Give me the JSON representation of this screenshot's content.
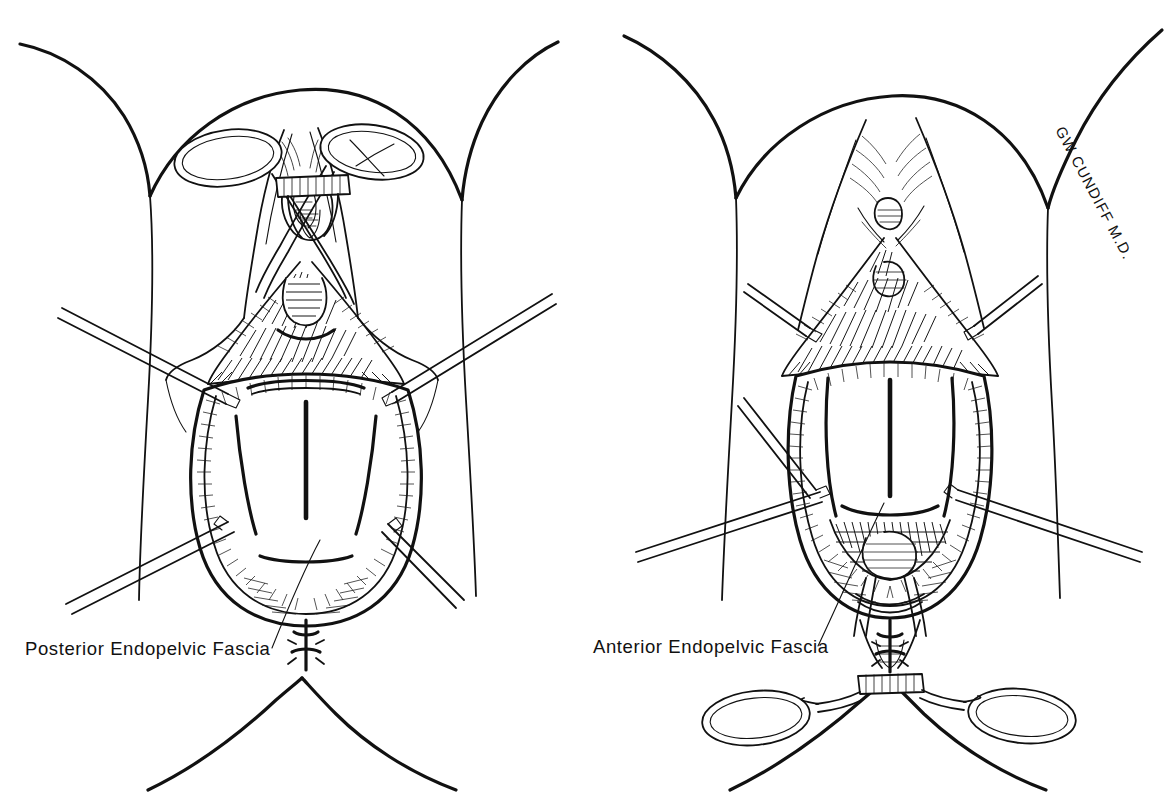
{
  "figure": {
    "kind": "medical-line-art",
    "background_color": "#ffffff",
    "ink_color": "#111111",
    "width": 1171,
    "height": 807
  },
  "panels": [
    {
      "id": "left",
      "name": "posterior-view",
      "label": "Posterior Endopelvic Fascia",
      "label_x": 25,
      "label_y": 655,
      "leader_from": [
        272,
        648
      ],
      "leader_to": [
        320,
        540
      ],
      "instruments": [
        {
          "name": "ring-forceps",
          "position": "superior",
          "state": "closed"
        },
        {
          "name": "allis-clamp-upper-left",
          "position": "left"
        },
        {
          "name": "allis-clamp-upper-right",
          "position": "right"
        },
        {
          "name": "allis-clamp-lower-left",
          "position": "left"
        },
        {
          "name": "allis-clamp-lower-right",
          "position": "right"
        }
      ],
      "anatomy": [
        "thigh-left",
        "thigh-right",
        "perineal-body",
        "vaginal-vault",
        "posterior-vaginal-wall",
        "endopelvic-fascia-plane",
        "anus"
      ]
    },
    {
      "id": "right",
      "name": "anterior-view",
      "label": "Anterior Endopelvic Fascia",
      "label_x": 593,
      "label_y": 653,
      "leader_from": [
        818,
        646
      ],
      "leader_to": [
        884,
        503
      ],
      "instruments": [
        {
          "name": "ring-forceps",
          "position": "inferior",
          "state": "closed"
        },
        {
          "name": "allis-clamp-upper-left",
          "position": "left"
        },
        {
          "name": "allis-clamp-upper-right",
          "position": "right"
        },
        {
          "name": "allis-clamp-lower-left",
          "position": "left"
        },
        {
          "name": "allis-clamp-lower-right",
          "position": "right"
        }
      ],
      "anatomy": [
        "thigh-left",
        "thigh-right",
        "mons-pubis",
        "urethral-meatus",
        "vaginal-vault",
        "anterior-vaginal-wall",
        "endopelvic-fascia-plane",
        "anus"
      ]
    }
  ],
  "signature": {
    "text": "GW CUNDIFF M.D.",
    "x": 1055,
    "y": 130,
    "rotation_deg": 62
  }
}
